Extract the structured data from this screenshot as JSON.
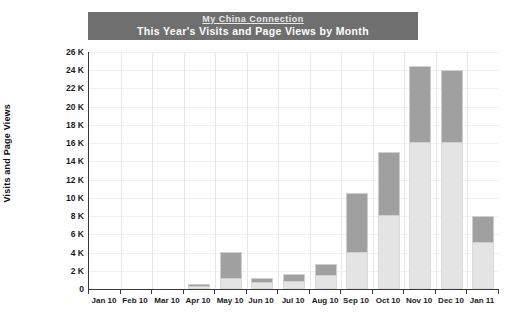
{
  "banner": {
    "link_text": "My China Connection",
    "subtitle": "This Year's Visits and Page Views by Month"
  },
  "chart_data": {
    "type": "bar",
    "stacked": true,
    "title": "This Year's Visits and Page Views by Month",
    "subtitle": "My China Connection",
    "xlabel": "",
    "ylabel": "Visits and Page Views",
    "ylim": [
      0,
      26000
    ],
    "ytick_labels": [
      "0",
      "2 K",
      "4 K",
      "6 K",
      "8 K",
      "10 K",
      "12 K",
      "14 K",
      "16 K",
      "18 K",
      "20 K",
      "22 K",
      "24 K",
      "26 K"
    ],
    "ytick_values": [
      0,
      2000,
      4000,
      6000,
      8000,
      10000,
      12000,
      14000,
      16000,
      18000,
      20000,
      22000,
      24000,
      26000
    ],
    "grid": true,
    "legend_position": "none",
    "categories": [
      "Jan 10",
      "Feb 10",
      "Mar 10",
      "Apr 10",
      "May 10",
      "Jun 10",
      "Jul 10",
      "Aug 10",
      "Sep 10",
      "Oct 10",
      "Nov 10",
      "Dec 10",
      "Jan 11"
    ],
    "series": [
      {
        "name": "Visits",
        "color": "#e4e4e4",
        "values": [
          0,
          0,
          0,
          200,
          1100,
          700,
          800,
          1400,
          4000,
          8000,
          16000,
          16000,
          5000
        ]
      },
      {
        "name": "Page Views",
        "color": "#a0a0a0",
        "values": [
          0,
          0,
          0,
          300,
          3000,
          500,
          800,
          1400,
          6500,
          7000,
          8500,
          8000,
          3000
        ]
      }
    ],
    "totals": [
      0,
      0,
      0,
      500,
      4100,
      1200,
      1600,
      2800,
      10500,
      15000,
      24500,
      24000,
      8000
    ]
  }
}
